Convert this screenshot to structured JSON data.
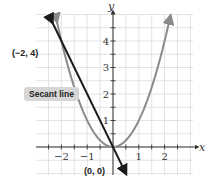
{
  "chart_data": {
    "type": "line",
    "title": "",
    "xlabel": "x",
    "ylabel": "y",
    "xlim": [
      -2.6,
      2.6
    ],
    "ylim": [
      -0.9,
      5.1
    ],
    "grid": true,
    "x_ticks": [
      -2,
      -1,
      1,
      2
    ],
    "y_ticks": [
      1,
      2,
      3,
      4
    ],
    "series": [
      {
        "name": "parabola y = x^2",
        "function": "x^2",
        "color": "#8a8a8a",
        "x": [
          -2.2,
          -2,
          -1.5,
          -1,
          -0.5,
          0,
          0.5,
          1,
          1.5,
          2,
          2.2
        ],
        "y": [
          4.84,
          4,
          2.25,
          1,
          0.25,
          0,
          0.25,
          1,
          2.25,
          4,
          4.84
        ]
      },
      {
        "name": "Secant line",
        "function": "-2x",
        "color": "#1a1a1a",
        "x": [
          -2.4,
          0.45
        ],
        "y": [
          4.8,
          -0.9
        ]
      }
    ],
    "points": [
      {
        "label": "(-2, 4)",
        "x": -2,
        "y": 4
      },
      {
        "label": "(0, 0)",
        "x": 0,
        "y": 0
      }
    ],
    "annotations": [
      "Secant line",
      "(-2, 4)",
      "(0, 0)"
    ]
  },
  "labels": {
    "point_a": "(−2, 4)",
    "point_b": "(0, 0)",
    "secant": "Secant line",
    "x_axis": "x",
    "y_axis": "y",
    "x_tick_labels": [
      "−2",
      "−1",
      "1",
      "2"
    ],
    "y_tick_labels": [
      "1",
      "2",
      "3",
      "4"
    ]
  }
}
